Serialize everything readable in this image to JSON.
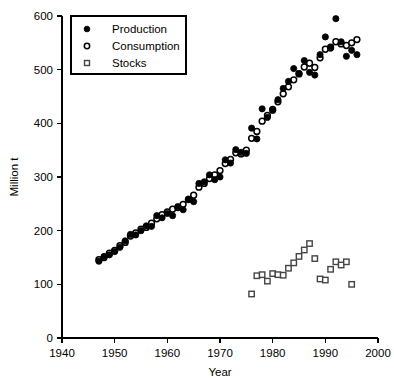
{
  "chart_data": {
    "type": "scatter",
    "title": "",
    "xlabel": "Year",
    "ylabel": "Million t",
    "xlim": [
      1940,
      2000
    ],
    "ylim": [
      0,
      600
    ],
    "xticks": [
      1940,
      1950,
      1960,
      1970,
      1980,
      1990,
      2000
    ],
    "yticks": [
      0,
      100,
      200,
      300,
      400,
      500,
      600
    ],
    "grid": false,
    "legend_position": "top-left",
    "series": [
      {
        "name": "Production",
        "marker": "filled-circle",
        "color": "#000000",
        "points": [
          [
            1947,
            143
          ],
          [
            1948,
            152
          ],
          [
            1949,
            155
          ],
          [
            1950,
            161
          ],
          [
            1951,
            169
          ],
          [
            1952,
            181
          ],
          [
            1953,
            193
          ],
          [
            1954,
            192
          ],
          [
            1955,
            200
          ],
          [
            1956,
            209
          ],
          [
            1957,
            208
          ],
          [
            1958,
            228
          ],
          [
            1959,
            224
          ],
          [
            1960,
            232
          ],
          [
            1961,
            228
          ],
          [
            1962,
            245
          ],
          [
            1963,
            239
          ],
          [
            1964,
            259
          ],
          [
            1965,
            254
          ],
          [
            1966,
            288
          ],
          [
            1967,
            291
          ],
          [
            1968,
            304
          ],
          [
            1969,
            295
          ],
          [
            1970,
            300
          ],
          [
            1971,
            332
          ],
          [
            1972,
            326
          ],
          [
            1973,
            351
          ],
          [
            1974,
            346
          ],
          [
            1975,
            344
          ],
          [
            1976,
            391
          ],
          [
            1977,
            371
          ],
          [
            1978,
            427
          ],
          [
            1979,
            411
          ],
          [
            1980,
            424
          ],
          [
            1981,
            444
          ],
          [
            1982,
            465
          ],
          [
            1983,
            478
          ],
          [
            1984,
            502
          ],
          [
            1985,
            493
          ],
          [
            1986,
            517
          ],
          [
            1987,
            495
          ],
          [
            1988,
            490
          ],
          [
            1989,
            528
          ],
          [
            1990,
            561
          ],
          [
            1991,
            540
          ],
          [
            1992,
            595
          ],
          [
            1993,
            552
          ],
          [
            1994,
            525
          ],
          [
            1995,
            536
          ],
          [
            1996,
            528
          ]
        ]
      },
      {
        "name": "Consumption",
        "marker": "open-circle",
        "color": "#000000",
        "points": [
          [
            1947,
            146
          ],
          [
            1948,
            150
          ],
          [
            1949,
            158
          ],
          [
            1950,
            163
          ],
          [
            1951,
            172
          ],
          [
            1952,
            178
          ],
          [
            1953,
            190
          ],
          [
            1954,
            196
          ],
          [
            1955,
            203
          ],
          [
            1956,
            206
          ],
          [
            1957,
            214
          ],
          [
            1958,
            222
          ],
          [
            1959,
            230
          ],
          [
            1960,
            235
          ],
          [
            1961,
            240
          ],
          [
            1962,
            243
          ],
          [
            1963,
            249
          ],
          [
            1964,
            258
          ],
          [
            1965,
            266
          ],
          [
            1966,
            281
          ],
          [
            1967,
            288
          ],
          [
            1968,
            297
          ],
          [
            1969,
            304
          ],
          [
            1970,
            312
          ],
          [
            1971,
            325
          ],
          [
            1972,
            333
          ],
          [
            1973,
            345
          ],
          [
            1974,
            343
          ],
          [
            1975,
            350
          ],
          [
            1976,
            372
          ],
          [
            1977,
            385
          ],
          [
            1978,
            404
          ],
          [
            1979,
            415
          ],
          [
            1980,
            426
          ],
          [
            1981,
            440
          ],
          [
            1982,
            455
          ],
          [
            1983,
            468
          ],
          [
            1984,
            481
          ],
          [
            1985,
            492
          ],
          [
            1986,
            505
          ],
          [
            1987,
            512
          ],
          [
            1988,
            504
          ],
          [
            1989,
            522
          ],
          [
            1990,
            538
          ],
          [
            1991,
            542
          ],
          [
            1992,
            552
          ],
          [
            1993,
            548
          ],
          [
            1994,
            545
          ],
          [
            1995,
            550
          ],
          [
            1996,
            556
          ]
        ]
      },
      {
        "name": "Stocks",
        "marker": "open-square",
        "color": "#444444",
        "points": [
          [
            1976,
            82
          ],
          [
            1977,
            116
          ],
          [
            1978,
            118
          ],
          [
            1979,
            106
          ],
          [
            1980,
            120
          ],
          [
            1981,
            118
          ],
          [
            1982,
            117
          ],
          [
            1983,
            130
          ],
          [
            1984,
            140
          ],
          [
            1985,
            152
          ],
          [
            1986,
            164
          ],
          [
            1987,
            176
          ],
          [
            1988,
            148
          ],
          [
            1989,
            110
          ],
          [
            1990,
            108
          ],
          [
            1991,
            128
          ],
          [
            1992,
            142
          ],
          [
            1993,
            136
          ],
          [
            1994,
            142
          ],
          [
            1995,
            100
          ]
        ]
      }
    ],
    "legend": [
      {
        "label": "Production",
        "marker": "filled-circle"
      },
      {
        "label": "Consumption",
        "marker": "open-circle"
      },
      {
        "label": "Stocks",
        "marker": "open-square"
      }
    ]
  }
}
